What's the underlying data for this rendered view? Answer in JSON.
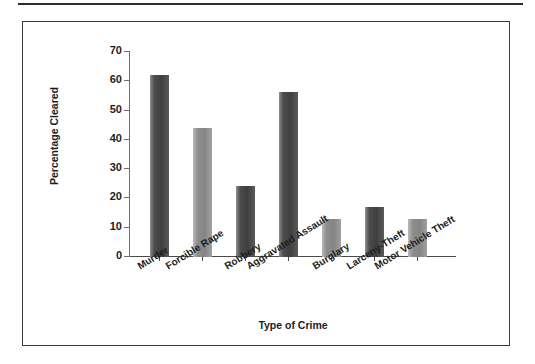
{
  "figure": {
    "background_color": "#ffffff",
    "frame_color": "#3a3a3a",
    "axis_color": "#4a4a4a"
  },
  "chart_data": {
    "type": "bar",
    "title": "",
    "subtitle": "",
    "xlabel": "Type of Crime",
    "ylabel": "Percentage Cleared",
    "categories": [
      "Murder",
      "Forcible Rape",
      "Robbery",
      "Aggravated Assault",
      "Burglary",
      "Larceny-Theft",
      "Motor Vehicle Theft"
    ],
    "values": [
      62,
      44,
      24,
      56,
      13,
      17,
      13
    ],
    "ylim": [
      0,
      70
    ],
    "yticks": [
      0,
      10,
      20,
      30,
      40,
      50,
      60,
      70
    ],
    "ytick_labels": [
      "0",
      "10",
      "20",
      "30",
      "40",
      "50",
      "60",
      "70"
    ],
    "grid": false,
    "legend": "none",
    "bar_colors": [
      "#444444",
      "#8a8a8a",
      "#444444",
      "#555555",
      "#9a9a9a",
      "#6b6b6b",
      "#9a9a9a"
    ],
    "bar_shades": [
      "dark",
      "light",
      "dark",
      "dark",
      "light",
      "dark",
      "light"
    ]
  }
}
